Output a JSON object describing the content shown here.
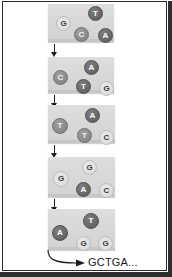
{
  "figure": {
    "panel_count": 5,
    "colors": {
      "panel_fill": "#d9d9d9",
      "base_dark": "#6b6b6b",
      "base_mid": "#8e8e8e",
      "base_light": "#e0e0e0",
      "arrow": "#1e1e1e",
      "frame": "#2a2a2a",
      "background": "#ffffff"
    },
    "panels": [
      {
        "index": 1,
        "bases": [
          {
            "letter": "T",
            "shade": "dark",
            "x": 40,
            "y": 2,
            "size": 13
          },
          {
            "letter": "G",
            "shade": "light",
            "x": 8,
            "y": 12,
            "size": 13
          },
          {
            "letter": "C",
            "shade": "mid",
            "x": 26,
            "y": 23,
            "size": 13
          },
          {
            "letter": "A",
            "shade": "dark",
            "x": 50,
            "y": 24,
            "size": 13
          }
        ]
      },
      {
        "index": 2,
        "bases": [
          {
            "letter": "A",
            "shade": "dark",
            "x": 36,
            "y": 3,
            "size": 13
          },
          {
            "letter": "C",
            "shade": "mid",
            "x": 5,
            "y": 13,
            "size": 13
          },
          {
            "letter": "T",
            "shade": "dark",
            "x": 28,
            "y": 22,
            "size": 13
          },
          {
            "letter": "G",
            "shade": "light",
            "x": 51,
            "y": 24,
            "size": 13
          }
        ]
      },
      {
        "index": 3,
        "bases": [
          {
            "letter": "A",
            "shade": "dark",
            "x": 37,
            "y": 3,
            "size": 13
          },
          {
            "letter": "T",
            "shade": "mid",
            "x": 4,
            "y": 13,
            "size": 14
          },
          {
            "letter": "T",
            "shade": "mid",
            "x": 29,
            "y": 23,
            "size": 13
          },
          {
            "letter": "C",
            "shade": "light",
            "x": 51,
            "y": 25,
            "size": 13
          }
        ]
      },
      {
        "index": 4,
        "bases": [
          {
            "letter": "G",
            "shade": "light",
            "x": 34,
            "y": 3,
            "size": 13
          },
          {
            "letter": "G",
            "shade": "light",
            "x": 5,
            "y": 14,
            "size": 14
          },
          {
            "letter": "A",
            "shade": "dark",
            "x": 28,
            "y": 25,
            "size": 13
          },
          {
            "letter": "C",
            "shade": "light",
            "x": 51,
            "y": 26,
            "size": 13
          }
        ]
      },
      {
        "index": 5,
        "bases": [
          {
            "letter": "T",
            "shade": "dark",
            "x": 35,
            "y": 4,
            "size": 14
          },
          {
            "letter": "A",
            "shade": "dark",
            "x": 4,
            "y": 16,
            "size": 14
          },
          {
            "letter": "G",
            "shade": "light",
            "x": 28,
            "y": 27,
            "size": 13
          },
          {
            "letter": "G",
            "shade": "light",
            "x": 50,
            "y": 27,
            "size": 13
          }
        ]
      }
    ],
    "arrows": [
      {
        "index": 1,
        "from_panel": 1,
        "to_panel": 2
      },
      {
        "index": 2,
        "from_panel": 2,
        "to_panel": 3
      },
      {
        "index": 3,
        "from_panel": 3,
        "to_panel": 4
      },
      {
        "index": 4,
        "from_panel": 4,
        "to_panel": 5
      }
    ],
    "output": {
      "label": "GCTGA...",
      "arrow_style": "curved"
    }
  }
}
